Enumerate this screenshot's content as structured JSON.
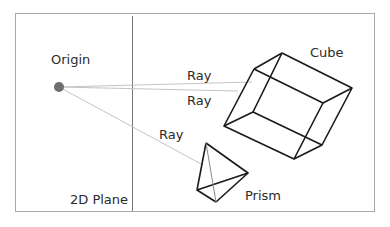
{
  "labels": {
    "origin": "Origin",
    "plane": "2D Plane",
    "cube": "Cube",
    "prism": "Prism",
    "ray1": "Ray",
    "ray2": "Ray",
    "ray3": "Ray"
  },
  "colors": {
    "frame": "#a8a8a8",
    "plane_line": "#777777",
    "ray": "#c4c4c4",
    "origin_dot": "#6e6e6e",
    "shape_stroke": "#1a1a1a",
    "text": "#2b2b2b"
  }
}
